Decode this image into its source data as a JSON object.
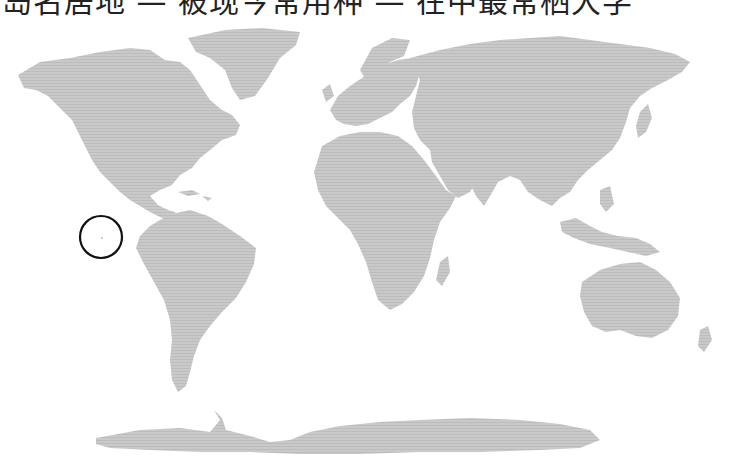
{
  "caption": {
    "text": "岛名居地 — 被现今常用种 — 在中最常栖大学"
  },
  "map": {
    "projection": "world-equirectangular",
    "land_color": "#c6c6c6",
    "land_stripe_color": "#b8b8b8",
    "background": "#ffffff",
    "marker": {
      "shape": "circle",
      "location": "Galápagos Islands (Eastern Pacific, off Ecuador)",
      "cx": 101,
      "cy": 237,
      "r": 21,
      "stroke": "#111111"
    },
    "regions": [
      "North America",
      "Greenland",
      "South America",
      "Europe",
      "Africa",
      "Asia",
      "Australia",
      "Antarctica"
    ]
  }
}
